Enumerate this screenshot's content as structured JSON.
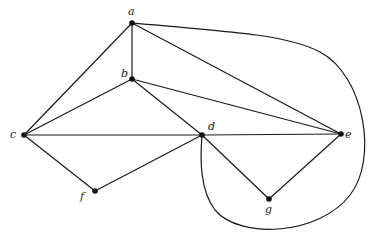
{
  "diagram": {
    "type": "graph",
    "nodes": [
      {
        "id": "a",
        "label": "a",
        "x": 132,
        "y": 23,
        "lx": 128,
        "ly": 15
      },
      {
        "id": "b",
        "label": "b",
        "x": 132,
        "y": 79,
        "lx": 121,
        "ly": 77
      },
      {
        "id": "c",
        "label": "c",
        "x": 24,
        "y": 135,
        "lx": 10,
        "ly": 138
      },
      {
        "id": "d",
        "label": "d",
        "x": 202,
        "y": 135,
        "lx": 208,
        "ly": 130
      },
      {
        "id": "e",
        "label": "e",
        "x": 341,
        "y": 134,
        "lx": 345,
        "ly": 138
      },
      {
        "id": "f",
        "label": "f",
        "x": 95,
        "y": 191,
        "lx": 80,
        "ly": 200
      },
      {
        "id": "g",
        "label": "g",
        "x": 269,
        "y": 199,
        "lx": 265,
        "ly": 213
      }
    ],
    "edges": [
      [
        "a",
        "b"
      ],
      [
        "a",
        "c"
      ],
      [
        "a",
        "e"
      ],
      [
        "b",
        "c"
      ],
      [
        "b",
        "d"
      ],
      [
        "b",
        "e"
      ],
      [
        "c",
        "d"
      ],
      [
        "c",
        "f"
      ],
      [
        "d",
        "e"
      ],
      [
        "d",
        "f"
      ],
      [
        "d",
        "g"
      ],
      [
        "e",
        "g"
      ]
    ],
    "curved_edges": [
      {
        "from": "a",
        "to": "d",
        "path": "M132,23 C240,32 290,36 320,52 C365,76 378,160 350,195 C320,235 240,240 215,210 C200,190 200,160 202,135"
      }
    ]
  }
}
